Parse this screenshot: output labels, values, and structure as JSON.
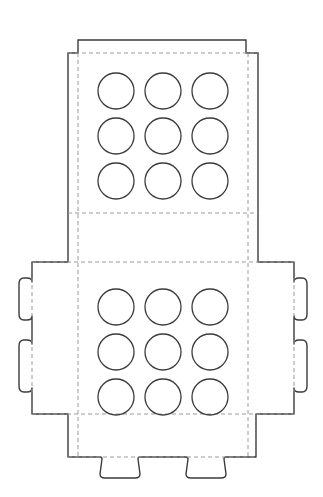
{
  "document": {
    "title": "Packaging Dieline Template",
    "type": "die-cut-layout",
    "background_color": "#ffffff",
    "width": 323,
    "height": 497
  },
  "styles": {
    "cut_line_color": "#3b3b3b",
    "cut_line_width": 1.4,
    "fold_line_color": "#9a9a9a",
    "fold_line_width": 1,
    "fold_dash_pattern": "4 3",
    "hole_line_color": "#3b3b3b",
    "hole_line_width": 1.3
  },
  "panels": {
    "top_lid": {
      "name": "Top Lid Panel",
      "outline_points": "78,40 246,40 246,53 258,53 258,212 246,212 246,213 78,213 78,53 68,53 68,212 68,40",
      "outer_rect": {
        "x": 78,
        "y": 40,
        "width": 168,
        "height": 173
      },
      "side_flap_left": {
        "x": 68,
        "y": 53,
        "width": 10,
        "height": 159
      },
      "side_flap_right": {
        "x": 246,
        "y": 53,
        "width": 12,
        "height": 159
      }
    },
    "base": {
      "name": "Base Panel",
      "outer_rect": {
        "x": 32,
        "y": 262,
        "width": 262,
        "height": 152
      },
      "inner_rect": {
        "x": 78,
        "y": 262,
        "width": 170,
        "height": 152
      }
    },
    "bottom_flap": {
      "name": "Bottom Flap",
      "rect": {
        "x": 68,
        "y": 414,
        "width": 188,
        "height": 43
      }
    }
  },
  "fold_lines": {
    "vertical_left_x": 78,
    "vertical_right_x": 248,
    "horizontal_top_y": 53,
    "horizontal_lid_bottom_y": 213,
    "horizontal_base_top_y": 262,
    "horizontal_base_bottom_y": 414,
    "horizontal_bottom_flap_y": 457,
    "side_tab_fold_left_x": 32,
    "side_tab_fold_right_x": 294
  },
  "tabs": {
    "side_tabs": {
      "count": 4,
      "shape": "rounded-rect",
      "depth": 14,
      "items": [
        {
          "name": "left-upper-tab",
          "side": "left",
          "y_top": 278,
          "y_bottom": 320
        },
        {
          "name": "left-lower-tab",
          "side": "left",
          "y_top": 340,
          "y_bottom": 392
        },
        {
          "name": "right-upper-tab",
          "side": "right",
          "y_top": 278,
          "y_bottom": 320
        },
        {
          "name": "right-lower-tab",
          "side": "right",
          "y_top": 340,
          "y_bottom": 392
        }
      ]
    },
    "bottom_tabs": {
      "count": 2,
      "shape": "rounded-trapezoid",
      "depth": 20,
      "items": [
        {
          "name": "bottom-left-tab",
          "x_left": 100,
          "x_right": 140
        },
        {
          "name": "bottom-right-tab",
          "x_left": 186,
          "x_right": 226
        }
      ]
    }
  },
  "hole_grids": [
    {
      "name": "top-lid-hole-grid",
      "rows": 3,
      "columns": 3,
      "radius": 18,
      "first_center_x": 116,
      "first_center_y": 91,
      "spacing_x": 47,
      "spacing_y": 45,
      "hole_labels": [
        "r1c1",
        "r1c2",
        "r1c3",
        "r2c1",
        "r2c2",
        "r2c3",
        "r3c1",
        "r3c2",
        "r3c3"
      ]
    },
    {
      "name": "base-hole-grid",
      "rows": 3,
      "columns": 3,
      "radius": 18,
      "first_center_x": 116,
      "first_center_y": 307,
      "spacing_x": 47,
      "spacing_y": 45,
      "hole_labels": [
        "r1c1",
        "r1c2",
        "r1c3",
        "r2c1",
        "r2c2",
        "r2c3",
        "r3c1",
        "r3c2",
        "r3c3"
      ]
    }
  ]
}
